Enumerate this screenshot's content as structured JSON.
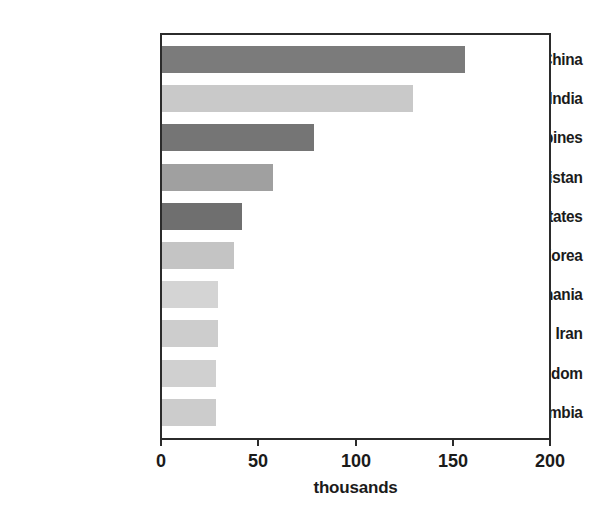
{
  "chart_data": {
    "type": "bar",
    "orientation": "horizontal",
    "title": "",
    "xlabel": "thousands",
    "ylabel": "",
    "xlim": [
      0,
      200
    ],
    "xticks": [
      0,
      50,
      100,
      150,
      200
    ],
    "xtick_labels": [
      "0",
      "50",
      "100",
      "150",
      "200"
    ],
    "grid": false,
    "legend": false,
    "categories": [
      "China",
      "India",
      "Philippines",
      "Pakistan",
      "United States",
      "South Korea",
      "Romania",
      "Iran",
      "United Kingdom",
      "Colombia"
    ],
    "values": [
      156,
      129,
      78,
      57,
      41,
      37,
      29,
      29,
      28,
      28
    ],
    "bar_colors": [
      "#7b7b7b",
      "#c9c9c9",
      "#757575",
      "#a0a0a0",
      "#6f6f6f",
      "#c4c4c4",
      "#d4d4d4",
      "#cdcdcd",
      "#d0d0d0",
      "#cccccc"
    ]
  },
  "axis": {
    "line_color": "#2b2b2b",
    "background": "#ffffff"
  }
}
